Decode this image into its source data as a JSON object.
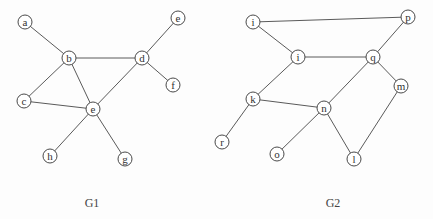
{
  "graphs": [
    {
      "id": "G1",
      "label": "G1",
      "label_pos": [
        92,
        203
      ],
      "nodes": [
        {
          "id": "a",
          "label": "a",
          "x": 25,
          "y": 22
        },
        {
          "id": "b",
          "label": "b",
          "x": 69,
          "y": 58
        },
        {
          "id": "d",
          "label": "d",
          "x": 142,
          "y": 58
        },
        {
          "id": "e_top",
          "label": "e",
          "x": 178,
          "y": 18
        },
        {
          "id": "f",
          "label": "f",
          "x": 173,
          "y": 85
        },
        {
          "id": "c",
          "label": "c",
          "x": 24,
          "y": 101
        },
        {
          "id": "e",
          "label": "e",
          "x": 93,
          "y": 109
        },
        {
          "id": "h",
          "label": "h",
          "x": 50,
          "y": 156
        },
        {
          "id": "g",
          "label": "g",
          "x": 125,
          "y": 159
        }
      ],
      "edges": [
        [
          "a",
          "b"
        ],
        [
          "b",
          "d"
        ],
        [
          "b",
          "c"
        ],
        [
          "b",
          "e"
        ],
        [
          "d",
          "e_top"
        ],
        [
          "d",
          "f"
        ],
        [
          "d",
          "e"
        ],
        [
          "c",
          "e"
        ],
        [
          "e",
          "h"
        ],
        [
          "e",
          "g"
        ]
      ]
    },
    {
      "id": "G2",
      "label": "G2",
      "label_pos": [
        333,
        203
      ],
      "nodes": [
        {
          "id": "i_top",
          "label": "i",
          "x": 253,
          "y": 22
        },
        {
          "id": "p",
          "label": "p",
          "x": 408,
          "y": 17
        },
        {
          "id": "i",
          "label": "i",
          "x": 298,
          "y": 57
        },
        {
          "id": "q",
          "label": "q",
          "x": 373,
          "y": 57
        },
        {
          "id": "m",
          "label": "m",
          "x": 401,
          "y": 86
        },
        {
          "id": "k",
          "label": "k",
          "x": 253,
          "y": 99
        },
        {
          "id": "n",
          "label": "n",
          "x": 324,
          "y": 108
        },
        {
          "id": "r",
          "label": "r",
          "x": 222,
          "y": 142
        },
        {
          "id": "o",
          "label": "o",
          "x": 277,
          "y": 154
        },
        {
          "id": "l",
          "label": "l",
          "x": 354,
          "y": 159
        }
      ],
      "edges": [
        [
          "i_top",
          "p"
        ],
        [
          "i_top",
          "i"
        ],
        [
          "p",
          "q"
        ],
        [
          "i",
          "q"
        ],
        [
          "i",
          "k"
        ],
        [
          "q",
          "n"
        ],
        [
          "q",
          "m"
        ],
        [
          "k",
          "n"
        ],
        [
          "k",
          "r"
        ],
        [
          "n",
          "o"
        ],
        [
          "n",
          "l"
        ],
        [
          "m",
          "l"
        ]
      ]
    }
  ],
  "style": {
    "node_radius": 7,
    "edge_color": "#5a5a5a",
    "node_stroke": "#4a4a4a",
    "background": "#fdfdfd"
  }
}
